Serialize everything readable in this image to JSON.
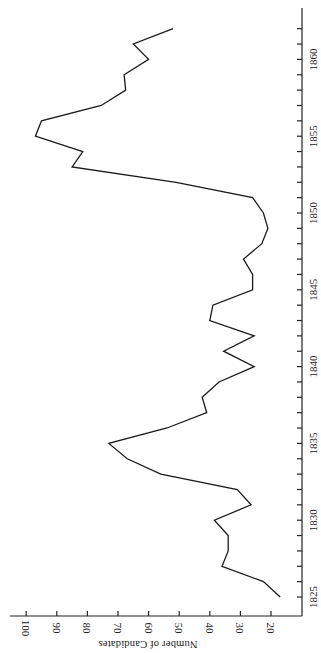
{
  "chart_data": {
    "type": "line",
    "title": "",
    "xlabel": "",
    "ylabel": "Number of Candidates",
    "orientation_note": "figure rotated 90 degrees: year axis vertical on right, value axis horizontal at bottom",
    "xlim": [
      1825,
      1862
    ],
    "ylim": [
      15,
      105
    ],
    "x_ticks": [
      1825,
      1830,
      1835,
      1840,
      1845,
      1850,
      1855,
      1860
    ],
    "x_tick_labels": [
      "1825",
      "1830",
      "1835",
      "1840",
      "1845",
      "1850",
      "1855",
      "1860"
    ],
    "y_ticks": [
      20,
      30,
      40,
      50,
      60,
      70,
      80,
      90,
      100
    ],
    "y_tick_labels": [
      "20",
      "30",
      "40",
      "50",
      "60",
      "70",
      "80",
      "90",
      "100"
    ],
    "grid": false,
    "legend": null,
    "x": [
      1825,
      1826,
      1827,
      1828,
      1829,
      1830,
      1831,
      1832,
      1833,
      1834,
      1835,
      1836,
      1837,
      1838,
      1839,
      1840,
      1841,
      1842,
      1843,
      1844,
      1845,
      1846,
      1847,
      1848,
      1849,
      1850,
      1851,
      1852,
      1853,
      1854,
      1855,
      1856,
      1857,
      1858,
      1859,
      1860,
      1861,
      1862
    ],
    "series": [
      {
        "name": "Number of Candidates",
        "values": [
          17,
          22.5,
          36,
          34,
          34,
          38.5,
          26.5,
          31,
          56,
          67,
          73,
          54,
          41,
          42.5,
          37,
          25.5,
          35.5,
          25.5,
          40,
          39,
          26,
          26,
          29,
          23,
          21,
          22.5,
          26,
          51,
          85,
          81.5,
          97,
          95,
          75.5,
          67.5,
          68,
          60,
          65,
          52
        ]
      }
    ]
  }
}
